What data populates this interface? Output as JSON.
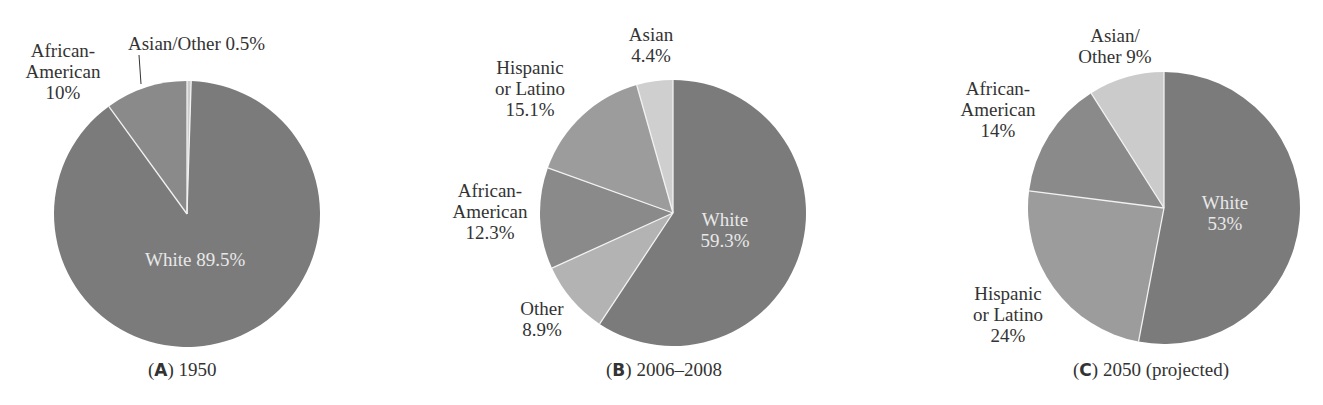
{
  "colors": {
    "white": "#7b7b7b",
    "african_american": "#8a8a8a",
    "hispanic": "#9c9c9c",
    "asian": "#cfcfcf",
    "other": "#b3b3b3",
    "asian_other": "#cbcbcb",
    "divider": "#f2f2f2"
  },
  "chart_data": [
    {
      "type": "pie",
      "title": "(A) 1950",
      "letter": "A",
      "caption": "1950",
      "slices": [
        {
          "label": "White",
          "value": 89.5,
          "display": "White 89.5%"
        },
        {
          "label": "African-American",
          "value": 10,
          "display": "African-American 10%"
        },
        {
          "label": "Asian/Other",
          "value": 0.5,
          "display": "Asian/Other 0.5%"
        }
      ]
    },
    {
      "type": "pie",
      "title": "(B) 2006–2008",
      "letter": "B",
      "caption": "2006–2008",
      "slices": [
        {
          "label": "White",
          "value": 59.3,
          "display": "White 59.3%"
        },
        {
          "label": "Other",
          "value": 8.9,
          "display": "Other 8.9%"
        },
        {
          "label": "African-American",
          "value": 12.3,
          "display": "African-American 12.3%"
        },
        {
          "label": "Hispanic or Latino",
          "value": 15.1,
          "display": "Hispanic or Latino 15.1%"
        },
        {
          "label": "Asian",
          "value": 4.4,
          "display": "Asian 4.4%"
        }
      ]
    },
    {
      "type": "pie",
      "title": "(C) 2050 (projected)",
      "letter": "C",
      "caption": "2050 (projected)",
      "slices": [
        {
          "label": "White",
          "value": 53,
          "display": "White 53%"
        },
        {
          "label": "Hispanic or Latino",
          "value": 24,
          "display": "Hispanic or Latino 24%"
        },
        {
          "label": "African-American",
          "value": 14,
          "display": "African-American 14%"
        },
        {
          "label": "Asian/Other",
          "value": 9,
          "display": "Asian/Other 9%"
        }
      ]
    }
  ],
  "labels": {
    "a": {
      "white": [
        "White 89.5%"
      ],
      "african_american": [
        "African-",
        "American",
        "10%"
      ],
      "asian_other": [
        "Asian/Other 0.5%"
      ]
    },
    "b": {
      "white": [
        "White",
        "59.3%"
      ],
      "other": [
        "Other",
        "8.9%"
      ],
      "african_american": [
        "African-",
        "American",
        "12.3%"
      ],
      "hispanic": [
        "Hispanic",
        "or Latino",
        "15.1%"
      ],
      "asian": [
        "Asian",
        "4.4%"
      ]
    },
    "c": {
      "white": [
        "White",
        "53%"
      ],
      "hispanic": [
        "Hispanic",
        "or Latino",
        "24%"
      ],
      "african_american": [
        "African-",
        "American",
        "14%"
      ],
      "asian_other": [
        "Asian/",
        "Other 9%"
      ]
    }
  },
  "captions": {
    "a": {
      "letter": "A",
      "text": "1950"
    },
    "b": {
      "letter": "B",
      "text": "2006–2008"
    },
    "c": {
      "letter": "C",
      "text": "2050 (projected)"
    }
  }
}
